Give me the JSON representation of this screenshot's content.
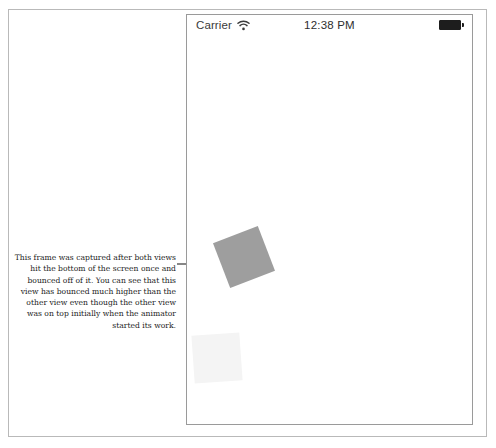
{
  "figure": {
    "caption": "This frame was captured after both views hit the bottom of the screen once and bounced off of it. You can see that this view has bounced much higher than the other view even though the other view was on top initially when the animator started its work.",
    "leader_arrow_label": "points to the upper animated view"
  },
  "device": {
    "status_bar": {
      "carrier": "Carrier",
      "wifi_icon": "wifi-icon",
      "time": "12:38 PM",
      "battery_icon": "battery-full-icon"
    },
    "views": [
      {
        "name": "upper-animated-view",
        "fill": "#9e9e9e",
        "rotation_deg": -21,
        "size_px": 48,
        "center_x": 243,
        "center_y": 256
      },
      {
        "name": "lower-animated-view",
        "fill": "#f4f4f4",
        "rotation_deg": -4,
        "size_px": 48,
        "center_x": 216,
        "center_y": 357
      }
    ]
  },
  "colors": {
    "page_border": "#b9b9b9",
    "device_border": "#9a9a9a",
    "text": "#1a1a1a",
    "status_text": "#3a3a3a",
    "battery": "#1d1d1d"
  }
}
